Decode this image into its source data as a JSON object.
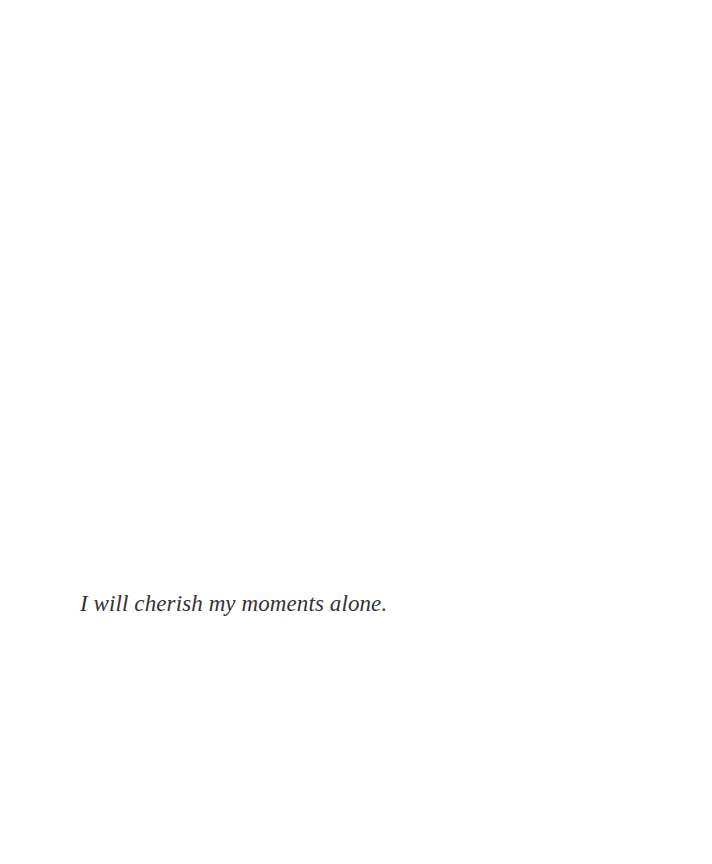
{
  "page": {
    "background": "#ffffff",
    "text_color": "#333333",
    "lines": [
      {
        "text": "I will cherish my moments alone."
      }
    ]
  }
}
